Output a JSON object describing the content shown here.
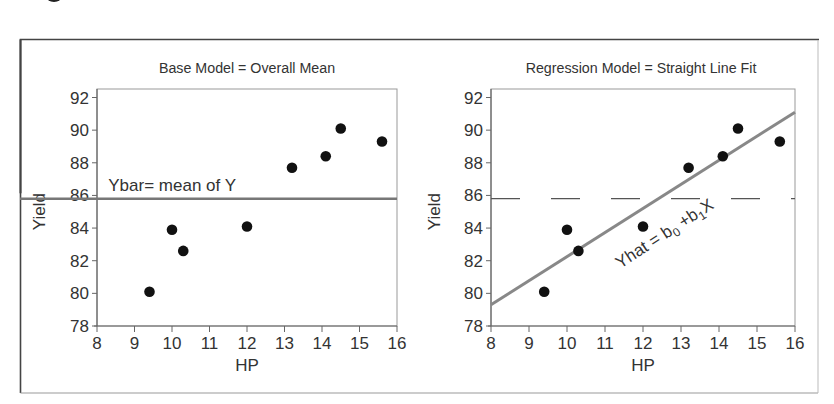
{
  "chart_data": [
    {
      "type": "scatter",
      "title": "Base Model = Overall Mean",
      "xlabel": "HP",
      "ylabel": "Yield",
      "xlim": [
        8,
        16
      ],
      "ylim": [
        78,
        92
      ],
      "xticks": [
        "8",
        "9",
        "10",
        "11",
        "12",
        "13",
        "14",
        "15",
        "16"
      ],
      "yticks": [
        "78",
        "80",
        "82",
        "84",
        "86",
        "88",
        "90",
        "92"
      ],
      "grid": false,
      "points": [
        {
          "x": 9.4,
          "y": 80.1
        },
        {
          "x": 10.0,
          "y": 83.9
        },
        {
          "x": 10.3,
          "y": 82.6
        },
        {
          "x": 12.0,
          "y": 84.1
        },
        {
          "x": 13.2,
          "y": 87.7
        },
        {
          "x": 14.1,
          "y": 88.4
        },
        {
          "x": 14.5,
          "y": 90.1
        },
        {
          "x": 15.6,
          "y": 89.3
        }
      ],
      "reference_line": {
        "type": "horizontal",
        "y": 85.8,
        "style": "solid",
        "color": "#777777"
      },
      "annotations": [
        {
          "text": "Ybar= mean of Y",
          "x": 8.3,
          "y": 86.3
        }
      ]
    },
    {
      "type": "scatter",
      "title": "Regression Model = Straight Line Fit",
      "xlabel": "HP",
      "ylabel": "Yield",
      "xlim": [
        8,
        16
      ],
      "ylim": [
        78,
        92
      ],
      "xticks": [
        "8",
        "9",
        "10",
        "11",
        "12",
        "13",
        "14",
        "15",
        "16"
      ],
      "yticks": [
        "78",
        "80",
        "82",
        "84",
        "86",
        "88",
        "90",
        "92"
      ],
      "grid": false,
      "points": [
        {
          "x": 9.4,
          "y": 80.1
        },
        {
          "x": 10.0,
          "y": 83.9
        },
        {
          "x": 10.3,
          "y": 82.6
        },
        {
          "x": 12.0,
          "y": 84.1
        },
        {
          "x": 13.2,
          "y": 87.7
        },
        {
          "x": 14.1,
          "y": 88.4
        },
        {
          "x": 14.5,
          "y": 90.1
        },
        {
          "x": 15.6,
          "y": 89.3
        }
      ],
      "reference_line": {
        "type": "horizontal",
        "y": 85.8,
        "style": "dashed",
        "color": "#555555"
      },
      "fit_line": {
        "x0": 8,
        "y0": 79.3,
        "x1": 16,
        "y1": 91.1,
        "color": "#888888"
      },
      "annotations": [
        {
          "text": "Yhat = b0 +b1X",
          "rotation": -33,
          "x": 11.4,
          "y": 81.5
        }
      ]
    }
  ],
  "colors": {
    "point": "#111111",
    "axis": "#666666",
    "mean_line": "#7a7a7a",
    "fit_line": "#8a8a8a",
    "frame": "#444444",
    "text": "#333333"
  }
}
